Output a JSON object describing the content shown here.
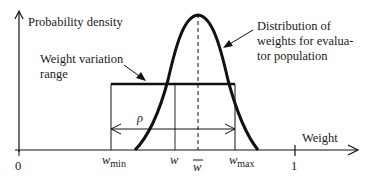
{
  "diagram": {
    "y_axis_label": "Probability density",
    "x_axis_label": "Weight",
    "annotation_range": {
      "line1": "Weight variation",
      "line2": "range"
    },
    "annotation_distribution": {
      "line1": "Distribution of",
      "line2": "weights for evalua-",
      "line3": "tor population"
    },
    "rho_label": "ρ",
    "ticks": {
      "origin": "0",
      "w_min": {
        "base": "w",
        "sub": "min"
      },
      "w": "w",
      "w_bar": "w",
      "w_max": {
        "base": "w",
        "sub": "max"
      },
      "one": "1"
    },
    "colors": {
      "line": "#111111",
      "background": "#ffffff"
    }
  }
}
